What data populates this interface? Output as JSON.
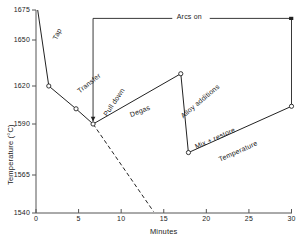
{
  "chart_data": {
    "type": "line",
    "title": "",
    "xlabel": "Minutes",
    "ylabel": "Temperature  (°C)",
    "xlim": [
      0,
      30
    ],
    "ylim": [
      1540,
      1675
    ],
    "grid": false,
    "legend": "none",
    "xticks": [
      0,
      5,
      10,
      15,
      20,
      25,
      30
    ],
    "xtick_labels": [
      "0",
      "5",
      "10",
      "15",
      "20",
      "25",
      "30"
    ],
    "yticks": [
      1540,
      1565,
      1590,
      1620,
      1650,
      1675
    ],
    "ytick_labels": [
      "1540",
      "1565",
      "1590",
      "1620",
      "1650",
      "1675"
    ],
    "series": [
      {
        "name": "melt-thermal-history",
        "style": "solid",
        "markers": "open-circle",
        "points": [
          {
            "x": 0.2,
            "y": 1675
          },
          {
            "x": 1.5,
            "y": 1620
          },
          {
            "x": 4.7,
            "y": 1602
          },
          {
            "x": 6.7,
            "y": 1590
          },
          {
            "x": 17.0,
            "y": 1628
          },
          {
            "x": 17.9,
            "y": 1576
          },
          {
            "x": 30.0,
            "y": 1604
          }
        ]
      },
      {
        "name": "natural-cooling-extrapolation",
        "style": "dashed",
        "markers": "none",
        "points": [
          {
            "x": 6.7,
            "y": 1590
          },
          {
            "x": 13.8,
            "y": 1541
          }
        ]
      }
    ],
    "annotations": [
      {
        "name": "tap",
        "text": "Tap",
        "x": 2.5,
        "y": 1655,
        "rotation": -64
      },
      {
        "name": "transfer",
        "text": "Transfer",
        "x": 6.2,
        "y": 1622,
        "rotation": -38
      },
      {
        "name": "pull-down",
        "text": "Pull down",
        "x": 9.1,
        "y": 1607,
        "rotation": -56
      },
      {
        "name": "degas",
        "text": "Degas",
        "x": 12.2,
        "y": 1600,
        "rotation": -22
      },
      {
        "name": "alloy-additions",
        "text": "Alloy  additions",
        "x": 19.3,
        "y": 1608,
        "rotation": -40
      },
      {
        "name": "mix-restore",
        "text": "Mix  + restore",
        "x": 21.0,
        "y": 1583,
        "rotation": -24
      },
      {
        "name": "temperature-note",
        "text": "Temperature",
        "x": 23.7,
        "y": 1577,
        "rotation": -24
      },
      {
        "name": "arcs-on",
        "text": "Arcs on",
        "x": 18.0,
        "y": 1670,
        "rotation": 0
      }
    ],
    "bracket": {
      "name": "arcs-on-bracket",
      "label": "Arcs on",
      "x_start": 6.7,
      "x_end": 30.0,
      "y_level": 1668,
      "left_drop_to": 1592,
      "right_drop_to": 1604
    }
  }
}
